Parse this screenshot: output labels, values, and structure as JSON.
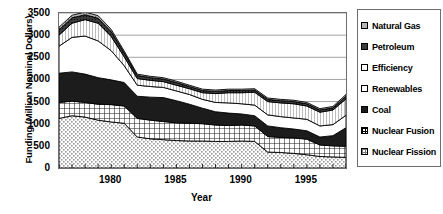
{
  "chart_data": {
    "type": "area",
    "stacked": true,
    "title": "",
    "xlabel": "Year",
    "ylabel": "Funding (Million Nominal Dollars)",
    "ylim": [
      0,
      3500
    ],
    "ytick_labels": [
      "0",
      "500",
      "1000",
      "1500",
      "2000",
      "2500",
      "3000",
      "3500"
    ],
    "ytick_values": [
      0,
      500,
      1000,
      1500,
      2000,
      2500,
      3000,
      3500
    ],
    "xlim": [
      1976,
      1998
    ],
    "xtick_labels": [
      "1980",
      "1985",
      "1990",
      "1995"
    ],
    "xtick_values": [
      1980,
      1985,
      1990,
      1995
    ],
    "grid": "horizontal",
    "legend_position": "right",
    "x": [
      1976,
      1977,
      1978,
      1979,
      1980,
      1981,
      1982,
      1983,
      1984,
      1985,
      1986,
      1987,
      1988,
      1989,
      1990,
      1991,
      1992,
      1993,
      1994,
      1995,
      1996,
      1997,
      1998
    ],
    "series": [
      {
        "name": "Nuclear Fission",
        "pattern": "light-stipple",
        "values": [
          1120,
          1180,
          1150,
          1080,
          1040,
          1010,
          700,
          660,
          640,
          620,
          610,
          610,
          600,
          600,
          610,
          600,
          360,
          350,
          330,
          300,
          260,
          250,
          240
        ]
      },
      {
        "name": "Nuclear Fusion",
        "pattern": "crosshatch",
        "values": [
          360,
          330,
          330,
          360,
          390,
          390,
          420,
          420,
          410,
          400,
          400,
          390,
          370,
          360,
          360,
          350,
          350,
          340,
          350,
          350,
          260,
          250,
          250
        ]
      },
      {
        "name": "Coal",
        "pattern": "solid-black",
        "values": [
          660,
          660,
          640,
          600,
          560,
          530,
          500,
          520,
          540,
          500,
          430,
          350,
          300,
          280,
          250,
          230,
          240,
          220,
          200,
          190,
          180,
          230,
          420
        ]
      },
      {
        "name": "Renewables",
        "pattern": "white",
        "values": [
          610,
          780,
          860,
          830,
          660,
          380,
          250,
          240,
          230,
          220,
          220,
          200,
          210,
          230,
          230,
          240,
          250,
          250,
          250,
          260,
          250,
          250,
          280
        ]
      },
      {
        "name": "Efficiency",
        "pattern": "vertical-lines",
        "values": [
          250,
          320,
          370,
          400,
          320,
          200,
          150,
          140,
          130,
          130,
          130,
          150,
          200,
          230,
          250,
          290,
          300,
          310,
          320,
          300,
          310,
          330,
          370
        ]
      },
      {
        "name": "Petroleum",
        "pattern": "dark-dense",
        "values": [
          120,
          120,
          110,
          110,
          110,
          90,
          70,
          60,
          60,
          60,
          50,
          50,
          50,
          50,
          50,
          50,
          50,
          50,
          50,
          50,
          50,
          50,
          60
        ]
      },
      {
        "name": "Natural Gas",
        "pattern": "gray-dot",
        "values": [
          60,
          60,
          60,
          60,
          50,
          40,
          30,
          30,
          30,
          30,
          30,
          30,
          30,
          30,
          30,
          30,
          30,
          30,
          30,
          30,
          30,
          30,
          40
        ]
      }
    ],
    "legend_order": [
      "Natural Gas",
      "Petroleum",
      "Efficiency",
      "Renewables",
      "Coal",
      "Nuclear Fusion",
      "Nuclear Fission"
    ]
  }
}
